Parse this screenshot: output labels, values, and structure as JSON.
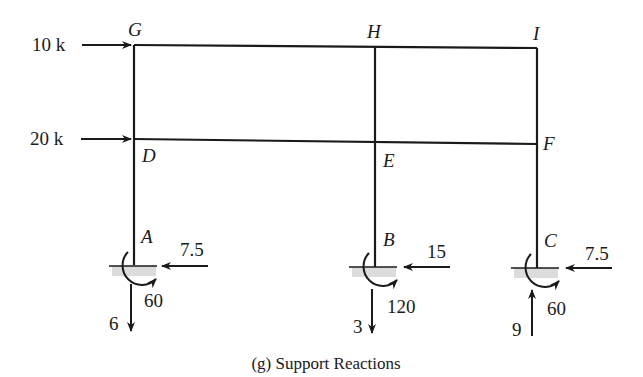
{
  "figure": {
    "caption": "(g) Support Reactions",
    "nodes": {
      "G": "G",
      "H": "H",
      "I": "I",
      "D": "D",
      "E": "E",
      "F": "F",
      "A": "A",
      "B": "B",
      "C": "C"
    },
    "applied_loads": [
      {
        "label": "10 k",
        "at": "G",
        "direction": "right"
      },
      {
        "label": "20 k",
        "at": "D",
        "direction": "right"
      }
    ],
    "supports": [
      {
        "node": "A",
        "horizontal": "7.5",
        "horizontal_dir": "left",
        "moment": "60",
        "vertical": "6",
        "vertical_dir": "down"
      },
      {
        "node": "B",
        "horizontal": "15",
        "horizontal_dir": "left",
        "moment": "120",
        "vertical": "3",
        "vertical_dir": "down"
      },
      {
        "node": "C",
        "horizontal": "7.5",
        "horizontal_dir": "left",
        "moment": "60",
        "vertical": "9",
        "vertical_dir": "up"
      }
    ],
    "colors": {
      "line": "#1a1a1a",
      "ground_hatch": "#d8d8d8",
      "background": "#ffffff"
    }
  }
}
